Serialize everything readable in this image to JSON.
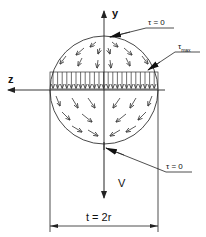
{
  "diagram": {
    "axes": {
      "y_label": "y",
      "z_label": "z",
      "force_label": "V"
    },
    "annotations": {
      "top_tau": "τ = 0",
      "max_tau_symbol": "τ",
      "max_tau_sub": "max",
      "bottom_tau": "τ = 0"
    },
    "dimension": {
      "label": "t = 2r"
    },
    "colors": {
      "line": "#222222",
      "background": "#ffffff"
    }
  }
}
